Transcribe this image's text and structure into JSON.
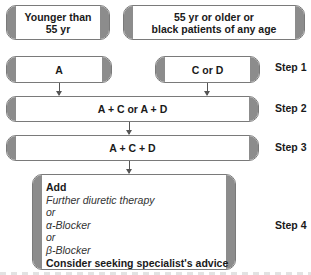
{
  "diagram": {
    "type": "flowchart",
    "populations": [
      {
        "id": "younger",
        "label_line1": "Younger than",
        "label_line2": "55 yr"
      },
      {
        "id": "older",
        "label_line1": "55 yr or older or",
        "label_line2": "black patients of any age"
      }
    ],
    "steps": [
      {
        "label": "Step 1",
        "boxes": [
          "A",
          "C or D"
        ]
      },
      {
        "label": "Step 2",
        "boxes": [
          "A + C or A + D"
        ]
      },
      {
        "label": "Step 3",
        "boxes": [
          "A + C + D"
        ]
      },
      {
        "label": "Step 4",
        "lines": [
          {
            "text": "Add",
            "style": "bold"
          },
          {
            "text": "Further diuretic therapy",
            "style": "italic"
          },
          {
            "text": "or",
            "style": "italic"
          },
          {
            "text": "α-Blocker",
            "style": "italic"
          },
          {
            "text": "or",
            "style": "italic"
          },
          {
            "text": "β-Blocker",
            "style": "italic"
          },
          {
            "text": "Consider seeking specialist's advice",
            "style": "bold"
          }
        ]
      }
    ],
    "edges": [
      {
        "from": "A",
        "to": "A + C or A + D"
      },
      {
        "from": "C or D",
        "to": "A + C or A + D"
      },
      {
        "from": "A + C or A + D",
        "to": "A + C + D"
      },
      {
        "from": "A + C + D",
        "to": "Step 4 box"
      }
    ],
    "colors": {
      "box_fill": "#ffffff",
      "box_cap": "#8c8c8c",
      "box_border": "#7a7a7a",
      "arrow": "#555555",
      "text": "#1a1a1a"
    }
  }
}
